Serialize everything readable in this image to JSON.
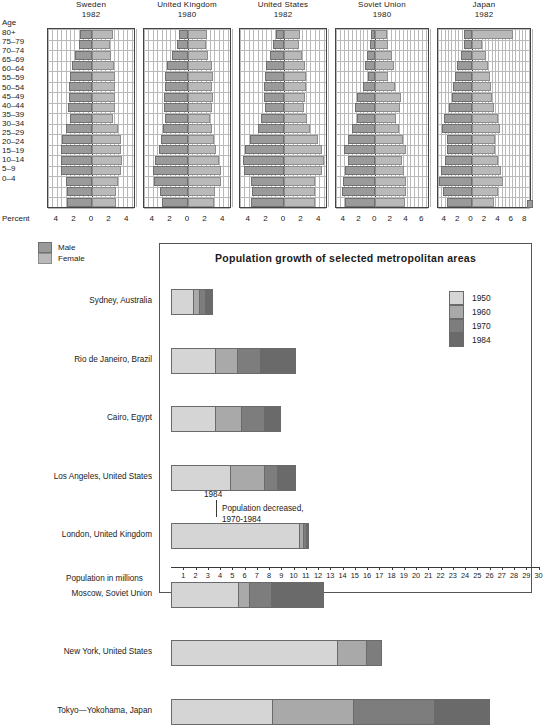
{
  "pyramids": {
    "age_axis_label": "Age",
    "percent_axis_label": "Percent",
    "age_groups": [
      "80+",
      "75–79",
      "70–74",
      "65–69",
      "60–64",
      "55–59",
      "50–54",
      "45–49",
      "40–44",
      "35–39",
      "30–34",
      "25–29",
      "20–24",
      "15–19",
      "10–14",
      "5–9",
      "0–4"
    ],
    "legend": [
      {
        "label": "Male",
        "color": "#9a9a9a"
      },
      {
        "label": "Female",
        "color": "#b9b9b9"
      }
    ],
    "countries": [
      {
        "name": "Sweden",
        "year": "1982",
        "ticks": [
          "4",
          "2",
          "0",
          "2",
          "4"
        ],
        "tick_values": [
          -4,
          -2,
          0,
          2,
          4
        ],
        "axis_min": -5,
        "axis_max": 5,
        "male": [
          1.4,
          1.5,
          1.9,
          2.3,
          2.5,
          2.6,
          2.6,
          2.7,
          2.5,
          3.0,
          3.4,
          3.5,
          3.5,
          3.5,
          3.0,
          2.8,
          2.8
        ],
        "female": [
          2.4,
          2.0,
          2.2,
          2.5,
          2.6,
          2.6,
          2.6,
          2.6,
          2.4,
          2.9,
          3.3,
          3.3,
          3.4,
          3.3,
          2.9,
          2.7,
          2.7
        ]
      },
      {
        "name": "United Kingdom",
        "year": "1980",
        "ticks": [
          "4",
          "2",
          "0",
          "2",
          "4"
        ],
        "tick_values": [
          -4,
          -2,
          0,
          2,
          4
        ],
        "axis_min": -5,
        "axis_max": 5,
        "male": [
          1.0,
          1.3,
          1.8,
          2.4,
          2.6,
          2.6,
          2.7,
          2.7,
          2.6,
          2.8,
          3.1,
          3.3,
          3.7,
          4.0,
          3.9,
          3.2,
          3.0
        ],
        "female": [
          2.2,
          2.0,
          2.3,
          2.7,
          2.8,
          2.7,
          2.8,
          2.7,
          2.5,
          2.7,
          3.0,
          3.2,
          3.5,
          3.8,
          3.7,
          3.1,
          2.9
        ]
      },
      {
        "name": "United States",
        "year": "1982",
        "ticks": [
          "4",
          "2",
          "0",
          "2",
          "4"
        ],
        "tick_values": [
          -4,
          -2,
          0,
          2,
          4
        ],
        "axis_min": -5,
        "axis_max": 5,
        "male": [
          0.9,
          1.2,
          1.6,
          2.0,
          2.2,
          2.3,
          2.3,
          2.2,
          2.6,
          3.0,
          3.9,
          4.4,
          4.7,
          4.5,
          3.7,
          3.6,
          3.7
        ],
        "female": [
          1.8,
          1.7,
          2.0,
          2.4,
          2.5,
          2.5,
          2.4,
          2.3,
          2.6,
          3.0,
          3.9,
          4.3,
          4.6,
          4.3,
          3.5,
          3.5,
          3.5
        ]
      },
      {
        "name": "Soviet Union",
        "year": "1980",
        "ticks": [
          "4",
          "2",
          "0",
          "2",
          "4",
          "6"
        ],
        "tick_values": [
          -4,
          -2,
          0,
          2,
          4,
          6
        ],
        "axis_min": -5,
        "axis_max": 7,
        "male": [
          0.5,
          0.7,
          1.0,
          1.3,
          0.9,
          1.5,
          2.3,
          2.6,
          2.3,
          3.0,
          3.5,
          4.0,
          3.5,
          3.8,
          4.1,
          4.2,
          3.9
        ],
        "female": [
          1.5,
          1.6,
          2.1,
          2.4,
          1.7,
          2.5,
          3.3,
          3.2,
          2.6,
          3.1,
          3.5,
          3.9,
          3.4,
          3.7,
          3.9,
          4.0,
          3.8
        ]
      },
      {
        "name": "Japan",
        "year": "1982",
        "ticks": [
          "4",
          "2",
          "0",
          "2",
          "4",
          "6",
          "8"
        ],
        "tick_values": [
          -4,
          -2,
          0,
          2,
          4,
          6,
          8
        ],
        "axis_min": -5,
        "axis_max": 9,
        "male": [
          1.2,
          1.2,
          1.6,
          2.1,
          2.4,
          2.7,
          2.9,
          3.3,
          4.1,
          4.4,
          3.6,
          3.6,
          4.0,
          4.6,
          4.9,
          4.2,
          3.6
        ],
        "female": [
          6.2,
          1.6,
          2.1,
          2.5,
          2.7,
          2.9,
          3.0,
          3.3,
          4.0,
          4.3,
          3.5,
          3.5,
          3.9,
          4.4,
          4.7,
          4.0,
          3.4
        ]
      }
    ]
  },
  "growth_chart": {
    "title": "Population growth of selected metropolitan areas",
    "axis_title": "Population in millions",
    "legend": [
      {
        "label": "1950",
        "color": "#d5d5d5"
      },
      {
        "label": "1960",
        "color": "#a9a9a9"
      },
      {
        "label": "1970",
        "color": "#7d7d7d"
      },
      {
        "label": "1984",
        "color": "#6a6a6a"
      }
    ],
    "annotation": {
      "year_label": "1984",
      "text": "Population decreased,\n1970-1984"
    },
    "axis_ticks": [
      "1",
      "2",
      "3",
      "4",
      "5",
      "6",
      "7",
      "8",
      "9",
      "10",
      "11",
      "12",
      "13",
      "14",
      "15",
      "16",
      "17",
      "18",
      "19",
      "20",
      "21",
      "22",
      "23",
      "24",
      "25",
      "26",
      "27",
      "28",
      "29",
      "30"
    ]
  },
  "chart_data": [
    {
      "type": "bar",
      "orientation": "horizontal-pyramid",
      "title": "Population pyramids by country",
      "xlabel": "Percent",
      "ylabel": "Age",
      "categories": [
        "80+",
        "75–79",
        "70–74",
        "65–69",
        "60–64",
        "55–59",
        "50–54",
        "45–49",
        "40–44",
        "35–39",
        "30–34",
        "25–29",
        "20–24",
        "15–19",
        "10–14",
        "5–9",
        "0–4"
      ],
      "legend_position": "below-left",
      "grid": true,
      "panels": [
        {
          "name": "Sweden 1982",
          "xlim": [
            -5,
            5
          ]
        },
        {
          "name": "United Kingdom 1980",
          "xlim": [
            -5,
            5
          ]
        },
        {
          "name": "United States 1982",
          "xlim": [
            -5,
            5
          ]
        },
        {
          "name": "Soviet Union 1980",
          "xlim": [
            -5,
            7
          ]
        },
        {
          "name": "Japan 1982",
          "xlim": [
            -5,
            9
          ]
        }
      ]
    },
    {
      "type": "bar",
      "orientation": "horizontal-stacked",
      "title": "Population growth of selected metropolitan areas",
      "xlabel": "Population in millions",
      "ylabel": "",
      "xlim": [
        0,
        30
      ],
      "grid": false,
      "legend_position": "right",
      "categories": [
        "Sydney, Australia",
        "Rio de Janeiro, Brazil",
        "Cairo, Egypt",
        "Los Angeles, United States",
        "London, United Kingdom",
        "Moscow, Soviet Union",
        "New York, United States",
        "Tokyo—Yokohama, Japan"
      ],
      "series": [
        {
          "name": "1950",
          "values": [
            1.7,
            3.5,
            3.5,
            4.7,
            10.4,
            5.4,
            13.5,
            8.2
          ]
        },
        {
          "name": "1960",
          "values": [
            2.2,
            5.3,
            5.6,
            7.5,
            10.7,
            6.3,
            15.8,
            14.8
          ]
        },
        {
          "name": "1970",
          "values": [
            2.7,
            7.2,
            7.5,
            8.6,
            10.9,
            8.1,
            17.2,
            21.4
          ]
        },
        {
          "name": "1984",
          "values": [
            3.4,
            10.2,
            9.0,
            10.2,
            11.3,
            12.5,
            17.0,
            26.0
          ]
        }
      ],
      "value_type": "cumulative-total-by-year"
    }
  ]
}
